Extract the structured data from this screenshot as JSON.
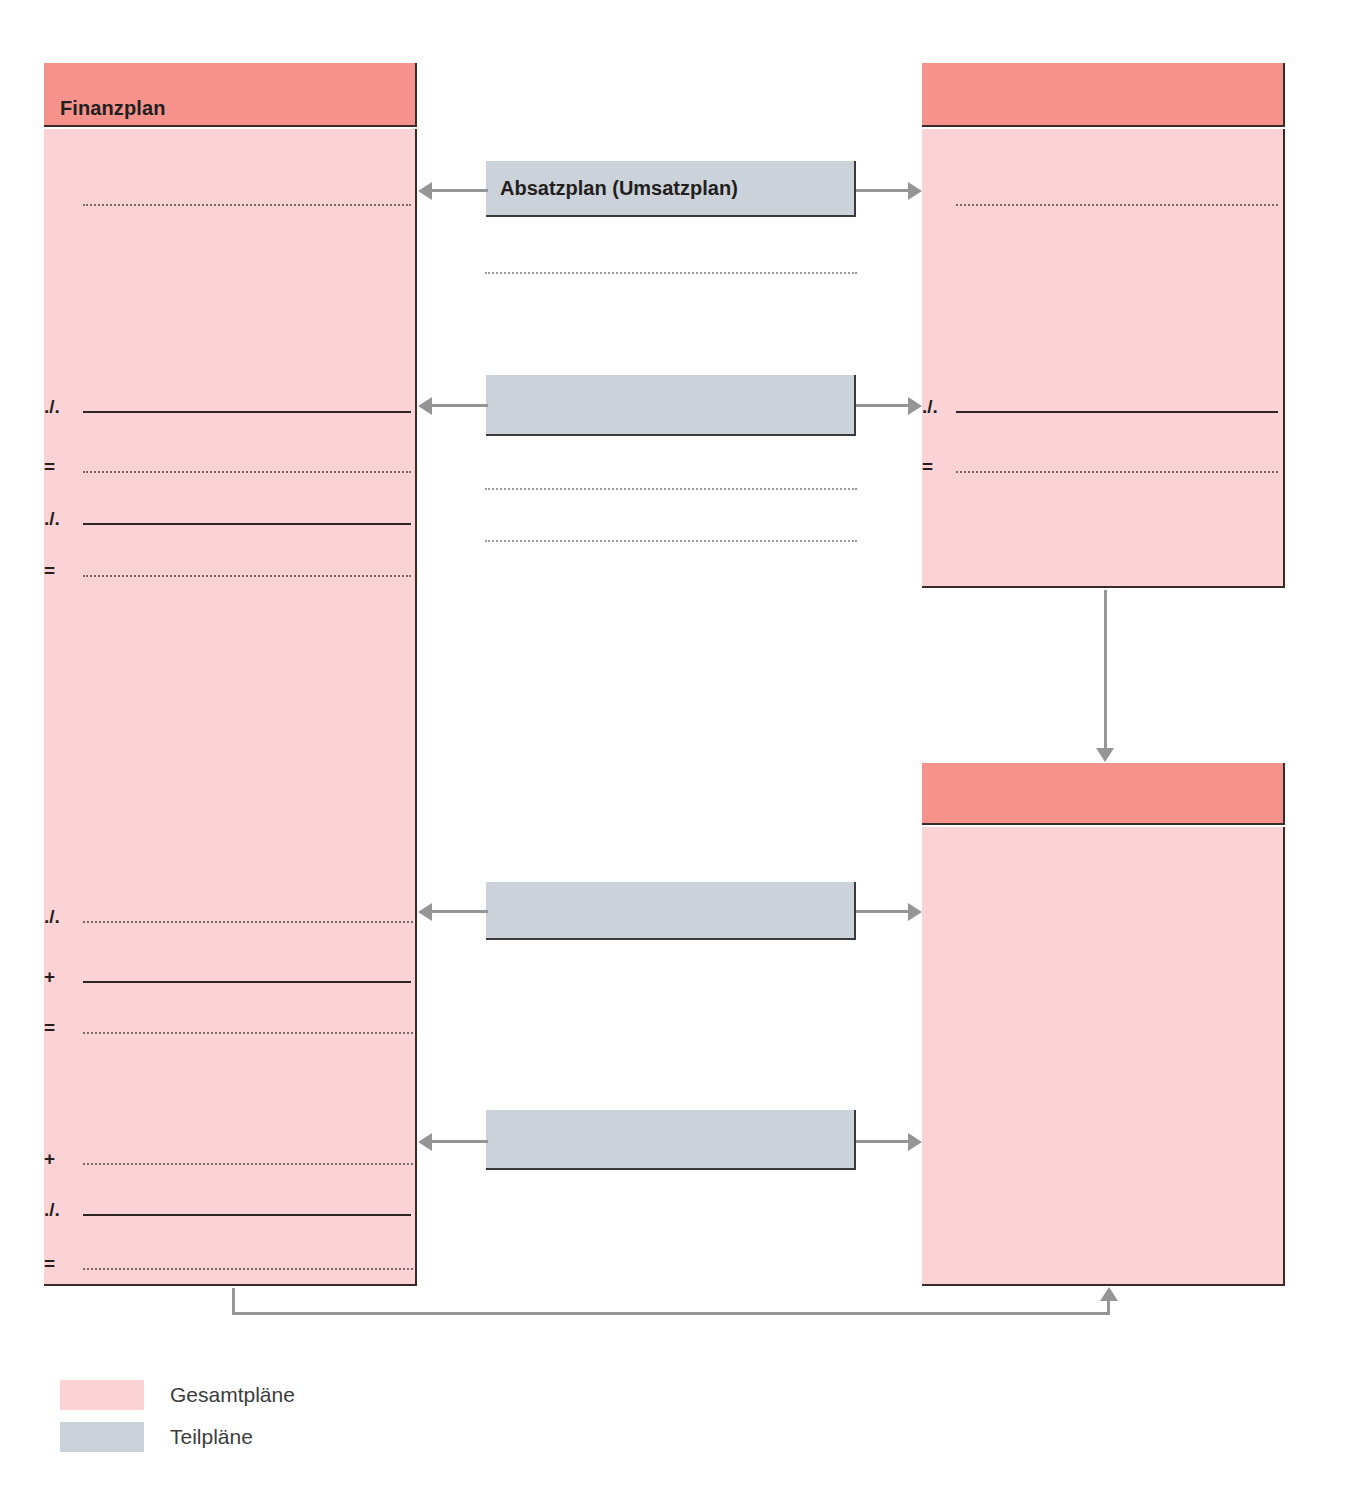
{
  "diagram": {
    "title_left_box": "Finanzplan",
    "center_box_top_label": "Absatzplan (Umsatzplan)",
    "center_box_2_label": "",
    "center_box_3_label": "",
    "center_box_4_label": "",
    "right_top_box_title": "",
    "right_bottom_box_title": "",
    "operators": {
      "minus": "./.",
      "plus": "+",
      "equals": "="
    }
  },
  "left_plan": {
    "title": "Finanzplan",
    "rows": [
      {
        "op": "",
        "style": "dotted"
      },
      {
        "op": "./.",
        "style": "solid"
      },
      {
        "op": "=",
        "style": "dotted"
      },
      {
        "op": "./.",
        "style": "solid"
      },
      {
        "op": "=",
        "style": "dotted"
      },
      {
        "op": "./.",
        "style": "dotted"
      },
      {
        "op": "+",
        "style": "solid"
      },
      {
        "op": "=",
        "style": "dotted"
      },
      {
        "op": "+",
        "style": "dotted"
      },
      {
        "op": "./.",
        "style": "solid"
      },
      {
        "op": "=",
        "style": "dotted"
      }
    ]
  },
  "right_top_plan": {
    "title": "",
    "rows": [
      {
        "op": "",
        "style": "dotted"
      },
      {
        "op": "./.",
        "style": "solid"
      },
      {
        "op": "=",
        "style": "dotted"
      }
    ]
  },
  "right_bottom_plan": {
    "title": "",
    "rows": []
  },
  "sub_plans": [
    {
      "label": "Absatzplan (Umsatzplan)"
    },
    {
      "label": ""
    },
    {
      "label": ""
    },
    {
      "label": ""
    }
  ],
  "center_free_lines": [
    {
      "style": "dotted"
    },
    {
      "style": "dotted"
    },
    {
      "style": "dotted"
    }
  ],
  "legend": {
    "items": [
      {
        "label": "Gesamtpläne",
        "color": "#fbd2d5"
      },
      {
        "label": "Teilpläne",
        "color": "#ccd2d9"
      }
    ]
  },
  "colors": {
    "header_salmon": "#f5928b",
    "body_pink": "#fbd2d5",
    "sub_gray": "#ccd2d9",
    "connector_gray": "#959595",
    "border_dark": "#3a2a2a",
    "text_dark": "#231f20"
  }
}
